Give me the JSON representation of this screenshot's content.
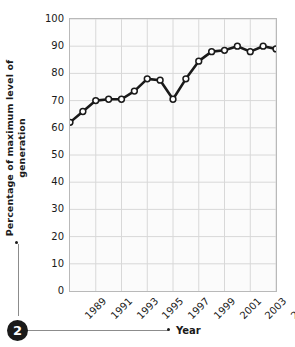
{
  "figure": {
    "badge_number": "2",
    "xlabel": "Year",
    "ylabel_line1": "Percentage of maximum level of",
    "ylabel_line2": "generation",
    "colors": {
      "line": "#1a1a1a",
      "marker_fill": "#ffffff",
      "marker_stroke": "#1a1a1a",
      "grid": "#d8d8d8",
      "plot_background": "#fbfbfb",
      "plot_border": "#b9b9b9",
      "badge_background": "#1a1a1a",
      "badge_text": "#ffffff"
    }
  },
  "chart_data": {
    "type": "line",
    "title": "",
    "xlabel": "Year",
    "ylabel": "Percentage of maximum level of generation",
    "xlim": [
      1989,
      2005
    ],
    "ylim": [
      0,
      100
    ],
    "grid": true,
    "legend": "none",
    "ytick_labels": [
      "100",
      "90",
      "80",
      "70",
      "60",
      "50",
      "40",
      "30",
      "20",
      "10",
      "0"
    ],
    "ytick_values": [
      100,
      90,
      80,
      70,
      60,
      50,
      40,
      30,
      20,
      10,
      0
    ],
    "xtick_labels": [
      "1989",
      "1991",
      "1993",
      "1995",
      "1997",
      "1999",
      "2001",
      "2003",
      "2005"
    ],
    "xtick_values": [
      1989,
      1991,
      1993,
      1995,
      1997,
      1999,
      2001,
      2003,
      2005
    ],
    "x": [
      1989,
      1990,
      1991,
      1992,
      1993,
      1994,
      1995,
      1996,
      1997,
      1998,
      1999,
      2000,
      2001,
      2002,
      2003,
      2004,
      2005
    ],
    "values": [
      62,
      66,
      70,
      70.5,
      70.5,
      73.5,
      78,
      77.5,
      70.5,
      78,
      84.5,
      88,
      88.5,
      90,
      88,
      90,
      89
    ],
    "series": [
      {
        "name": "Percentage of maximum level of generation",
        "marker": "open-circle",
        "values": [
          62,
          66,
          70,
          70.5,
          70.5,
          73.5,
          78,
          77.5,
          70.5,
          78,
          84.5,
          88,
          88.5,
          90,
          88,
          90,
          89
        ]
      }
    ]
  }
}
